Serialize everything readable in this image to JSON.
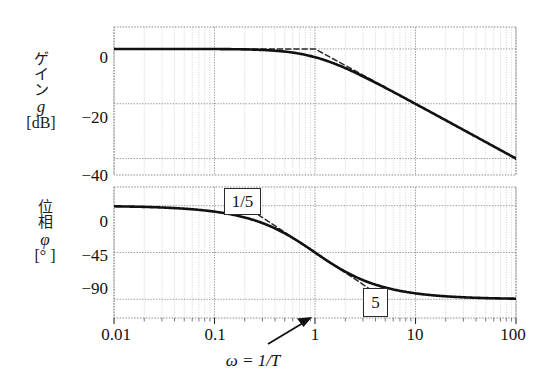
{
  "figure": {
    "kind": "bode-plot",
    "background": "#ffffff",
    "curve_color": "#111111",
    "asymptote_color": "#333333",
    "grid_major_color": "#9a9a9a",
    "grid_minor_color": "#c9c9c9",
    "frame_color": "#8a8a8a"
  },
  "gain_panel": {
    "y_label_chars": [
      "ゲ",
      "イ",
      "ン"
    ],
    "y_label_symbol": "g",
    "y_label_unit": "[dB]",
    "y_ticks": [
      "0",
      "−20",
      "−40"
    ],
    "y_tick_values": [
      0,
      -20,
      -40
    ],
    "ylim": [
      -46,
      8
    ]
  },
  "phase_panel": {
    "y_label_chars": [
      "位",
      "相"
    ],
    "y_label_symbol": "φ",
    "y_label_unit": "[° ]",
    "y_ticks": [
      "0",
      "−45",
      "−90"
    ],
    "y_tick_values": [
      0,
      -45,
      -90
    ],
    "ylim": [
      -108,
      18
    ]
  },
  "x_axis": {
    "title": "ω = 1/T",
    "ticks": [
      "0.01",
      "0.1",
      "1",
      "10",
      "100"
    ],
    "tick_values": [
      0.01,
      0.1,
      1,
      10,
      100
    ],
    "xlim": [
      0.01,
      100
    ],
    "scale": "log",
    "pointer_label": "1",
    "pointer_target": 1
  },
  "annotations": [
    {
      "name": "corner-low-box",
      "text": "1/5",
      "omega": 0.2,
      "panel": "phase"
    },
    {
      "name": "corner-high-box",
      "text": "5",
      "omega": 5,
      "panel": "phase"
    }
  ],
  "chart_data": {
    "type": "line",
    "title": "",
    "xlabel": "ω = 1/T",
    "xscale": "log",
    "xlim": [
      0.01,
      100
    ],
    "xticks": [
      0.01,
      0.1,
      1,
      10,
      100
    ],
    "grid": true,
    "legend": "none",
    "panels": [
      {
        "name": "gain",
        "ylabel": "ゲイン g [dB]",
        "ylim": [
          -46,
          8
        ],
        "yticks": [
          0,
          -20,
          -40
        ],
        "series": [
          {
            "name": "gain-exact",
            "style": "solid",
            "x": [
              0.01,
              0.02,
              0.05,
              0.1,
              0.2,
              0.3,
              0.5,
              0.7,
              1,
              1.5,
              2,
              3,
              5,
              7,
              10,
              20,
              30,
              50,
              70,
              100
            ],
            "y": [
              0.0,
              0.0,
              -0.01,
              -0.04,
              -0.17,
              -0.37,
              -0.97,
              -1.76,
              -3.01,
              -5.12,
              -6.99,
              -10.0,
              -14.15,
              -16.96,
              -20.04,
              -26.03,
              -29.54,
              -33.98,
              -36.9,
              -40.0
            ]
          },
          {
            "name": "gain-asymptote",
            "style": "dashed",
            "x": [
              0.2,
              0.5,
              1,
              2,
              5
            ],
            "y": [
              0,
              0,
              0,
              -6.02,
              -13.98
            ]
          }
        ]
      },
      {
        "name": "phase",
        "ylabel": "位相 φ [°]",
        "ylim": [
          -108,
          18
        ],
        "yticks": [
          0,
          -45,
          -90
        ],
        "series": [
          {
            "name": "phase-exact",
            "style": "solid",
            "x": [
              0.01,
              0.02,
              0.05,
              0.1,
              0.2,
              0.3,
              0.5,
              0.7,
              1,
              1.5,
              2,
              3,
              5,
              7,
              10,
              20,
              30,
              50,
              70,
              100
            ],
            "y": [
              -0.57,
              -1.15,
              -2.86,
              -5.71,
              -11.31,
              -16.7,
              -26.57,
              -34.99,
              -45.0,
              -56.31,
              -63.43,
              -71.57,
              -78.69,
              -81.87,
              -84.29,
              -87.14,
              -88.09,
              -88.85,
              -89.18,
              -89.43
            ]
          },
          {
            "name": "phase-asymptote",
            "style": "dashed",
            "x": [
              0.2,
              1,
              5
            ],
            "y": [
              0,
              -45,
              -90
            ]
          }
        ]
      }
    ]
  }
}
